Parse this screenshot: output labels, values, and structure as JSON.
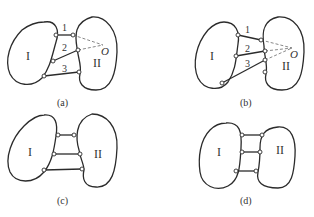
{
  "figure": {
    "panels": [
      {
        "id": "a",
        "caption": "(a)",
        "body_left": "I",
        "body_right": "II",
        "links": [
          {
            "label": "1"
          },
          {
            "label": "2"
          },
          {
            "label": "3"
          }
        ],
        "instant_center": "O"
      },
      {
        "id": "b",
        "caption": "(b)",
        "body_left": "I",
        "body_right": "II",
        "links": [
          {
            "label": "1"
          },
          {
            "label": "2"
          },
          {
            "label": "3"
          }
        ],
        "instant_center": "O"
      },
      {
        "id": "c",
        "caption": "(c)",
        "body_left": "I",
        "body_right": "II"
      },
      {
        "id": "d",
        "caption": "(d)",
        "body_left": "I",
        "body_right": "II"
      }
    ],
    "colors": {
      "stroke": "#2b2b2b",
      "background": "#ffffff"
    }
  }
}
